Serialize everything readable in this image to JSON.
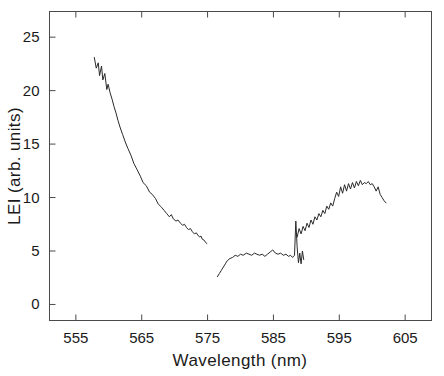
{
  "chart_data": {
    "type": "line",
    "title": "",
    "xlabel": "Wavelength (nm)",
    "ylabel": "LEI (arb. units)",
    "xlim": [
      551,
      609
    ],
    "ylim": [
      -1.5,
      27.4
    ],
    "xticks": [
      555,
      565,
      575,
      585,
      595,
      605
    ],
    "yticks": [
      0,
      5,
      10,
      15,
      20,
      25
    ],
    "xtick_labels": [
      "555",
      "565",
      "575",
      "585",
      "595",
      "605"
    ],
    "ytick_labels": [
      "0",
      "5",
      "10",
      "15",
      "20",
      "25"
    ],
    "grid": false,
    "legend": null,
    "frame": "box",
    "series": [
      {
        "name": "segment-1",
        "x": [
          557.8,
          558.1,
          558.4,
          558.6,
          558.9,
          559.1,
          559.4,
          559.7,
          559.9,
          560.2,
          560.5,
          560.8,
          561.1,
          561.4,
          561.7,
          562.1,
          562.5,
          562.9,
          563.4,
          563.8,
          564.3,
          564.8,
          565.2,
          565.7,
          566.2,
          566.6,
          567.1,
          567.5,
          568.0,
          568.4,
          568.8,
          569.2,
          569.5,
          569.8,
          570.2,
          570.5,
          570.9,
          571.2,
          571.5,
          571.8,
          572.1,
          572.4,
          572.7,
          573.0,
          573.3,
          573.5,
          573.8,
          574.0,
          574.2,
          574.5,
          574.7,
          574.9
        ],
        "y": [
          23.1,
          22.1,
          22.6,
          21.4,
          22.3,
          21.0,
          21.6,
          20.1,
          20.6,
          19.8,
          19.2,
          18.5,
          17.9,
          17.2,
          16.6,
          15.9,
          15.2,
          14.6,
          13.9,
          13.2,
          12.6,
          12.0,
          11.4,
          11.1,
          10.5,
          10.3,
          9.9,
          9.4,
          9.1,
          8.8,
          8.5,
          8.2,
          8.4,
          8.0,
          7.8,
          7.9,
          7.6,
          7.4,
          7.5,
          7.2,
          7.0,
          7.1,
          6.8,
          6.6,
          6.7,
          6.5,
          6.3,
          6.4,
          6.1,
          6.0,
          5.8,
          5.7
        ]
      },
      {
        "name": "segment-2",
        "x": [
          576.5,
          576.8,
          577.1,
          577.4,
          577.7,
          578.0,
          578.4,
          578.8,
          579.2,
          579.6,
          580.0,
          580.4,
          580.9,
          581.3,
          581.7,
          582.1,
          582.5,
          582.9,
          583.3,
          583.7,
          584.1,
          584.5,
          584.9,
          585.3,
          585.7,
          586.1,
          586.5,
          586.9,
          587.3,
          587.6,
          587.9,
          588.2,
          588.4,
          588.6,
          588.8,
          589.0,
          589.2,
          589.4,
          589.6
        ],
        "y": [
          2.6,
          2.9,
          3.2,
          3.5,
          3.8,
          4.1,
          4.3,
          4.4,
          4.6,
          4.5,
          4.7,
          4.6,
          4.8,
          4.7,
          4.6,
          4.8,
          4.7,
          4.6,
          4.7,
          4.5,
          4.7,
          4.9,
          5.1,
          4.8,
          4.7,
          4.8,
          4.6,
          4.7,
          4.5,
          4.6,
          4.4,
          4.6,
          7.8,
          5.4,
          3.9,
          4.8,
          3.8,
          5.0,
          4.2
        ]
      },
      {
        "name": "segment-3",
        "x": [
          588.6,
          588.9,
          589.2,
          589.5,
          589.8,
          590.1,
          590.4,
          590.7,
          591.0,
          591.3,
          591.6,
          591.9,
          592.2,
          592.5,
          592.8,
          593.1,
          593.4,
          593.7,
          594.0,
          594.3,
          594.6,
          594.9,
          595.2,
          595.5,
          595.8,
          596.1,
          596.4,
          596.7,
          597.0,
          597.3,
          597.6,
          597.9,
          598.2,
          598.5,
          598.8,
          599.1,
          599.4,
          599.7,
          600.0,
          600.3,
          600.6,
          600.9,
          601.2,
          601.5,
          601.8,
          602.1
        ],
        "y": [
          6.3,
          7.1,
          6.6,
          7.3,
          6.9,
          7.6,
          7.2,
          7.9,
          7.5,
          8.2,
          7.9,
          8.5,
          8.2,
          8.8,
          8.5,
          9.2,
          8.9,
          9.5,
          9.2,
          9.9,
          10.5,
          10.1,
          11.0,
          10.4,
          11.2,
          10.6,
          11.3,
          10.8,
          11.4,
          10.9,
          11.5,
          11.1,
          11.6,
          11.2,
          11.4,
          11.3,
          11.5,
          11.2,
          11.3,
          11.0,
          10.6,
          11.0,
          10.3,
          10.0,
          9.7,
          9.5
        ]
      }
    ]
  }
}
